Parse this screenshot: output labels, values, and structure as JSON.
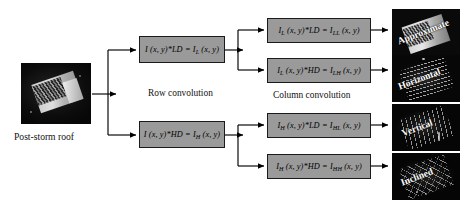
{
  "diagram": {
    "input": {
      "caption": "Post-storm roof",
      "image_name": "post-storm-roof-photo"
    },
    "stage1": {
      "label": "Row convolution",
      "boxes": [
        {
          "prefix": "I",
          "sub1": "",
          "op": " (x, y)*LD = ",
          "out": "I",
          "sub2": "L",
          "tail": " (x, y)"
        },
        {
          "prefix": "I",
          "sub1": "",
          "op": " (x, y)*HD = ",
          "out": "I",
          "sub2": "H",
          "tail": " (x, y)"
        }
      ]
    },
    "stage2": {
      "label": "Column convolution",
      "boxes": [
        {
          "prefix": "I",
          "sub1": "L",
          "op": " (x, y)*LD = ",
          "out": "I",
          "sub2": "LL",
          "tail": " (x, y)"
        },
        {
          "prefix": "I",
          "sub1": "L",
          "op": " (x, y)*HD = ",
          "out": "I",
          "sub2": "LH",
          "tail": " (x, y)"
        },
        {
          "prefix": "I",
          "sub1": "H",
          "op": " (x, y)*LD = ",
          "out": "I",
          "sub2": "HL",
          "tail": " (x, y)"
        },
        {
          "prefix": "I",
          "sub1": "H",
          "op": " (x, y)*HD = ",
          "out": "I",
          "sub2": "HH",
          "tail": " (x, y)"
        }
      ]
    },
    "outputs": [
      {
        "label": "Approximate",
        "image_name": "approximate-subband-image"
      },
      {
        "label": "Horizontal",
        "image_name": "horizontal-subband-image"
      },
      {
        "label": "Vertical",
        "image_name": "vertical-subband-image"
      },
      {
        "label": "Inclined",
        "image_name": "inclined-subband-image"
      }
    ],
    "colors": {
      "box_fill": "#9a9a9a",
      "box_border": "#1a1a1a",
      "arrow": "#000000",
      "photo_bg": "#0a0a0a",
      "label_text": "#ffffff"
    }
  }
}
